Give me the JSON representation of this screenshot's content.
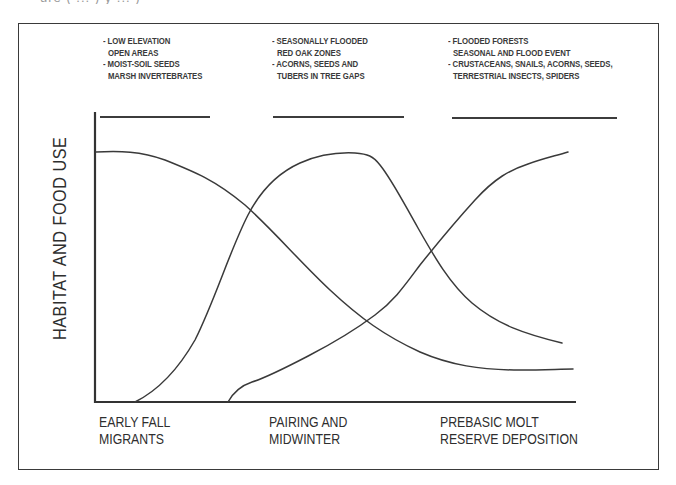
{
  "caption_fragment": "ure ( ... ) y ... )",
  "diagram": {
    "title": "",
    "y_axis_label": "HABITAT AND FOOD USE",
    "habitat_columns": [
      {
        "lines": [
          "- LOW ELEVATION",
          "OPEN AREAS",
          "- MOIST-SOIL SEEDS",
          "MARSH INVERTEBRATES"
        ]
      },
      {
        "lines": [
          "- SEASONALLY FLOODED",
          "RED OAK ZONES",
          "- ACORNS, SEEDS AND",
          "TUBERS IN TREE GAPS"
        ]
      },
      {
        "lines": [
          "- FLOODED FORESTS",
          "SEASONAL AND FLOOD EVENT",
          "- CRUSTACEANS, SNAILS, ACORNS, SEEDS,",
          "TERRESTRIAL INSECTS, SPIDERS"
        ]
      }
    ],
    "phases": [
      {
        "line1": "EARLY FALL",
        "line2": "MIGRANTS"
      },
      {
        "line1": "PAIRING AND",
        "line2": "MIDWINTER"
      },
      {
        "line1": "PREBASIC MOLT",
        "line2": "RESERVE DEPOSITION"
      }
    ],
    "curves": [
      {
        "name": "early-fall-migrants-curve",
        "description": "High at start, declines through midwinter, low by prebasic molt",
        "path": "M96,152 C120,151 140,151 165,160 C195,172 215,180 245,205 C275,232 300,262 330,290 C360,318 385,336 420,352 C450,365 480,370 520,370 C545,370 560,369 573,369"
      },
      {
        "name": "pairing-midwinter-curve",
        "description": "Rises from zero, peaks in midwinter, declines afterward",
        "path": "M135,402 C155,392 175,375 195,340 C215,300 230,250 248,215 C262,188 280,172 300,163 C318,155 335,152 355,153 C368,154 373,156 380,165 C392,180 402,200 418,228 C435,258 450,284 472,303 C498,325 525,334 562,343"
      },
      {
        "name": "prebasic-molt-curve",
        "description": "Starts later, rises steadily, high at prebasic molt",
        "path": "M228,402 C233,393 240,386 252,382 C268,377 285,368 310,355 C335,342 355,330 375,315 C395,300 405,285 420,265 C440,240 455,222 475,200 C495,178 510,170 528,164 C545,158 555,156 568,152"
      }
    ],
    "axes": {
      "origin_x": 95,
      "origin_y": 402,
      "y_top": 113,
      "x_end": 575,
      "color": "#333333"
    }
  }
}
